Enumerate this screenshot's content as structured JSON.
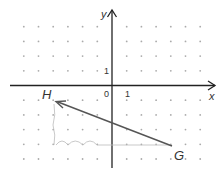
{
  "diagram": {
    "type": "coordinate-grid-vector",
    "axes": {
      "x_label": "x",
      "y_label": "y",
      "origin_label": "0",
      "x_unit_label": "1",
      "y_unit_label": "1"
    },
    "grid": {
      "x_range": [
        -6,
        6
      ],
      "y_range": [
        -5,
        4
      ],
      "style": "dots"
    },
    "points": [
      {
        "name": "G",
        "x": 4,
        "y": -4
      },
      {
        "name": "H",
        "x": -4,
        "y": -1
      }
    ],
    "vector": {
      "from": "G",
      "to": "H",
      "color": "#555555"
    },
    "path_hint": {
      "horizontal": "loops from x=4 to x=-4 at y=-4",
      "vertical": "from y=-4 to y=-1 at x=-4",
      "color": "#bbbbbb"
    }
  }
}
